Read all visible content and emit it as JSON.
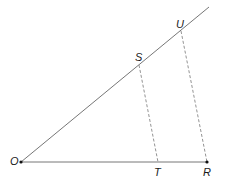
{
  "diagram": {
    "stroke_color": "#555555",
    "points": {
      "O": {
        "label": "O",
        "x": 21,
        "y": 162
      },
      "S": {
        "label": "S",
        "x": 139,
        "y": 65
      },
      "U": {
        "label": "U",
        "x": 181,
        "y": 31
      },
      "T": {
        "label": "T",
        "x": 158,
        "y": 162
      },
      "R": {
        "label": "R",
        "x": 207,
        "y": 162
      }
    },
    "lines": [
      {
        "from": "O",
        "to": "ray-end",
        "style": "solid"
      },
      {
        "from": "O",
        "to": "R",
        "style": "solid"
      },
      {
        "from": "S",
        "to": "T",
        "style": "dashed"
      },
      {
        "from": "U",
        "to": "R",
        "style": "dashed"
      }
    ]
  }
}
